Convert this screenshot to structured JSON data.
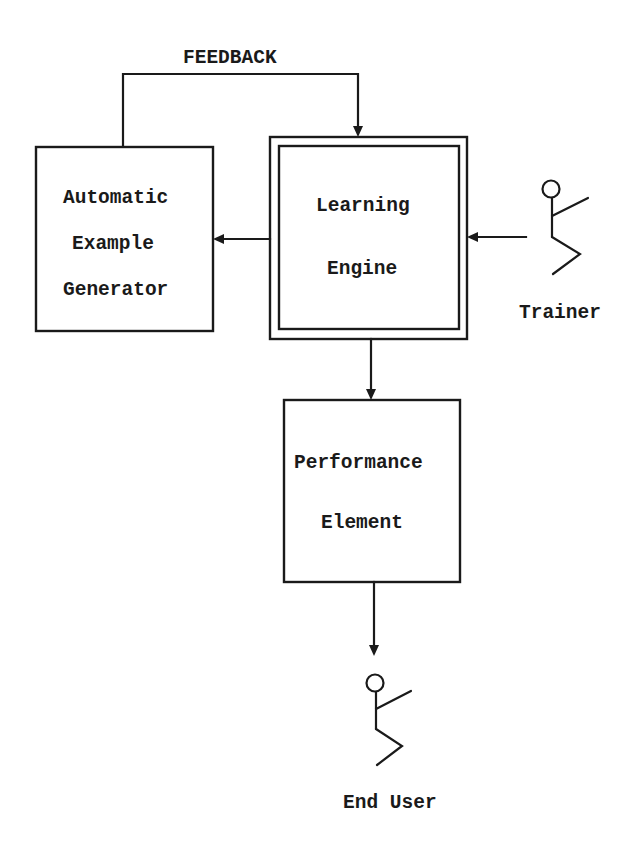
{
  "diagram": {
    "feedback_label": "FEEDBACK",
    "nodes": {
      "example_generator": {
        "lines": [
          "Automatic",
          "Example",
          "Generator"
        ]
      },
      "learning_engine": {
        "lines": [
          "Learning",
          "Engine"
        ]
      },
      "performance_element": {
        "lines": [
          "Performance",
          "Element"
        ]
      }
    },
    "actors": {
      "trainer": {
        "label": "Trainer",
        "icon": "stick-figure-icon"
      },
      "end_user": {
        "label": "End User",
        "icon": "stick-figure-icon"
      }
    },
    "edges": [
      {
        "from": "example_generator",
        "to": "learning_engine",
        "label": "FEEDBACK"
      },
      {
        "from": "learning_engine",
        "to": "example_generator",
        "label": ""
      },
      {
        "from": "trainer",
        "to": "learning_engine",
        "label": ""
      },
      {
        "from": "learning_engine",
        "to": "performance_element",
        "label": ""
      },
      {
        "from": "performance_element",
        "to": "end_user",
        "label": ""
      }
    ],
    "colors": {
      "stroke": "#1a1a1a",
      "background": "#ffffff"
    }
  }
}
